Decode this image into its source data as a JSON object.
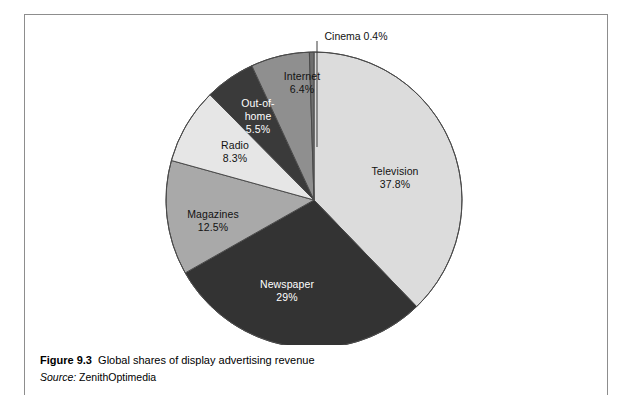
{
  "figure": {
    "number_label": "Figure 9.3",
    "title": "Global shares of display advertising revenue",
    "source_label": "Source:",
    "source_value": "ZenithOptimedia"
  },
  "chart_data": {
    "type": "pie",
    "title": "Global shares of display advertising revenue",
    "source": "ZenithOptimedia",
    "unit": "percent",
    "start_angle_deg": 0,
    "direction": "clockwise",
    "total": 100.0,
    "legend": "none-inline-labels",
    "categories": [
      "Television",
      "Newspaper",
      "Magazines",
      "Radio",
      "Out-of-home",
      "Internet",
      "Cinema"
    ],
    "values": [
      37.8,
      29.0,
      12.5,
      8.3,
      5.5,
      6.4,
      0.4
    ],
    "value_labels": [
      "37.8%",
      "29%",
      "12.5%",
      "8.3%",
      "5.5%",
      "6.4%",
      "0.4%"
    ],
    "slices": [
      {
        "name": "Television",
        "value": 37.8,
        "value_label": "37.8%",
        "color": "#dcdcdc",
        "text_color": "#121212",
        "start_deg": 0.0,
        "end_deg": 136.08,
        "callout": false
      },
      {
        "name": "Newspaper",
        "value": 29.0,
        "value_label": "29%",
        "color": "#333333",
        "text_color": "#ffffff",
        "start_deg": 136.08,
        "end_deg": 240.48,
        "callout": false
      },
      {
        "name": "Magazines",
        "value": 12.5,
        "value_label": "12.5%",
        "color": "#a9a9a9",
        "text_color": "#121212",
        "start_deg": 240.48,
        "end_deg": 285.48,
        "callout": false
      },
      {
        "name": "Radio",
        "value": 8.3,
        "value_label": "8.3%",
        "color": "#e6e6e6",
        "text_color": "#121212",
        "start_deg": 285.48,
        "end_deg": 315.36,
        "callout": false
      },
      {
        "name": "Out-of-home",
        "value": 5.5,
        "value_label": "5.5%",
        "color": "#3a3a3a",
        "text_color": "#ffffff",
        "start_deg": 315.36,
        "end_deg": 335.16,
        "callout": false,
        "name_line1": "Out-of-",
        "name_line2": "home"
      },
      {
        "name": "Internet",
        "value": 6.4,
        "value_label": "6.4%",
        "color": "#8f8f8f",
        "text_color": "#121212",
        "start_deg": 335.16,
        "end_deg": 358.2,
        "callout": false
      },
      {
        "name": "Cinema",
        "value": 0.4,
        "value_label": "0.4%",
        "color": "#6e6e6e",
        "text_color": "#121212",
        "start_deg": 358.2,
        "end_deg": 360.0,
        "callout": true,
        "callout_text": "Cinema 0.4%"
      }
    ]
  }
}
